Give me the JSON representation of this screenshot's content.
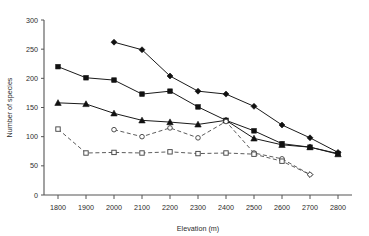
{
  "chart_data": {
    "type": "line",
    "title": "",
    "xlabel": "Elevation (m)",
    "ylabel": "Number of species",
    "xlim": [
      1750,
      2850
    ],
    "ylim": [
      0,
      300
    ],
    "xticks": [
      1800,
      1900,
      2000,
      2100,
      2200,
      2300,
      2400,
      2500,
      2600,
      2700,
      2800
    ],
    "yticks": [
      0,
      50,
      100,
      150,
      200,
      250,
      300
    ],
    "grid": false,
    "legend": "none",
    "x": [
      1800,
      1900,
      2000,
      2100,
      2200,
      2300,
      2400,
      2500,
      2600,
      2700,
      2800
    ],
    "series": [
      {
        "name": "series-filled-diamond",
        "marker": "filled-diamond",
        "line": "solid",
        "x": [
          2000,
          2100,
          2200,
          2300,
          2400,
          2500,
          2600,
          2700,
          2800
        ],
        "values": [
          262,
          249,
          204,
          178,
          173,
          152,
          120,
          98,
          73
        ]
      },
      {
        "name": "series-filled-square",
        "marker": "filled-square",
        "line": "solid",
        "x": [
          1800,
          1900,
          2000,
          2100,
          2200,
          2300,
          2400,
          2500,
          2600,
          2700,
          2800
        ],
        "values": [
          220,
          201,
          197,
          173,
          178,
          151,
          128,
          110,
          88,
          82,
          71
        ]
      },
      {
        "name": "series-filled-triangle",
        "marker": "filled-triangle",
        "line": "solid",
        "x": [
          1800,
          1900,
          2000,
          2100,
          2200,
          2300,
          2400,
          2500,
          2600,
          2700,
          2800
        ],
        "values": [
          158,
          156,
          140,
          128,
          125,
          121,
          128,
          97,
          86,
          82,
          70
        ]
      },
      {
        "name": "series-open-circle",
        "marker": "open-circle",
        "line": "dashed",
        "x": [
          2000,
          2100,
          2200,
          2300,
          2400,
          2500,
          2600,
          2700
        ],
        "values": [
          112,
          100,
          115,
          98,
          126,
          72,
          62,
          35
        ]
      },
      {
        "name": "series-open-square",
        "marker": "open-square",
        "line": "dashed",
        "x": [
          1800,
          1900,
          2000,
          2100,
          2200,
          2300,
          2400,
          2500,
          2600,
          2700
        ],
        "values": [
          113,
          72,
          73,
          72,
          74,
          71,
          72,
          70,
          58,
          35
        ]
      }
    ]
  }
}
